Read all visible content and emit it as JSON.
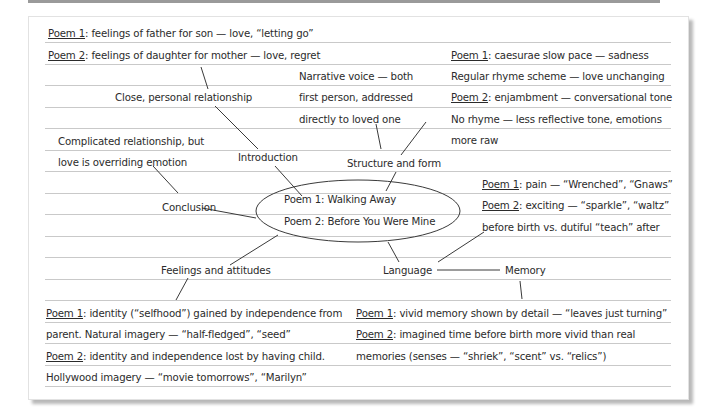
{
  "center": {
    "line1": "Poem 1: Walking Away",
    "line2": "Poem 2: Before You Were Mine"
  },
  "branches": {
    "introduction": "Introduction",
    "structure": "Structure and form",
    "conclusion": "Conclusion",
    "feelings": "Feelings and attitudes",
    "language": "Language",
    "memory": "Memory"
  },
  "notes": {
    "intro_top": {
      "p1_label": "Poem 1",
      "p1_text": ": feelings of father for son — love, “letting go”",
      "p2_label": "Poem 2",
      "p2_text": ": feelings of daughter for mother — love, regret"
    },
    "intro_relationship": "Close, personal relationship",
    "narrative": {
      "l1": "Narrative voice — both",
      "l2": "first person, addressed",
      "l3": "directly to loved one"
    },
    "structure_notes": {
      "p1_label": "Poem 1",
      "p1_text": ": caesurae slow pace — sadness",
      "l2": "Regular rhyme scheme — love unchanging",
      "p2_label": "Poem 2",
      "p2_text": ": enjambment — conversational tone",
      "l4": "No rhyme — less reflective tone, emotions",
      "l5": "more raw"
    },
    "conclusion_note": {
      "l1": "Complicated relationship, but",
      "l2": "love is overriding emotion"
    },
    "language_notes": {
      "p1_label": "Poem 1",
      "p1_text": ": pain — “Wrenched”, “Gnaws”",
      "p2_label": "Poem 2",
      "p2_text": ": exciting — “sparkle”, “waltz”",
      "l3": "before birth vs. dutiful “teach” after"
    },
    "feelings_notes": {
      "p1_label": "Poem 1",
      "p1_text": ": identity (“selfhood”) gained by independence from",
      "l2": "parent.  Natural imagery — “half-fledged”, “seed”",
      "p2_label": "Poem 2",
      "p2_text": ": identity and independence lost by having child.",
      "l4": "Hollywood imagery — “movie tomorrows”, “Marilyn”"
    },
    "memory_notes": {
      "p1_label": "Poem 1",
      "p1_text": ": vivid memory shown by detail — “leaves just turning”",
      "p2_label": "Poem 2",
      "p2_text": ": imagined time before birth more vivid than real",
      "l3": "memories (senses — “shriek”, “scent” vs. “relics”)"
    }
  },
  "colors": {
    "ink": "#2b2b2b",
    "rule": "#c9c9c9",
    "paper": "#ffffff"
  }
}
